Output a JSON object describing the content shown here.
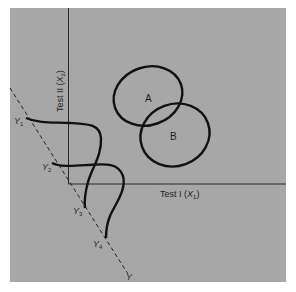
{
  "figure": {
    "background_color": "#a7a7a7",
    "ink_color": "#111111",
    "axes": {
      "x_label": "Test I",
      "x_symbol": "X",
      "x_sub": "1",
      "y_label": "Test II",
      "y_symbol": "X",
      "y_sub": "2"
    },
    "groups": [
      {
        "label": "A"
      },
      {
        "label": "B"
      }
    ],
    "discriminant_axis": {
      "label": "Y",
      "points": [
        {
          "label": "Y",
          "sub": "1"
        },
        {
          "label": "Y",
          "sub": "2"
        },
        {
          "label": "Y",
          "sub": "3"
        },
        {
          "label": "Y",
          "sub": "4"
        }
      ]
    }
  }
}
